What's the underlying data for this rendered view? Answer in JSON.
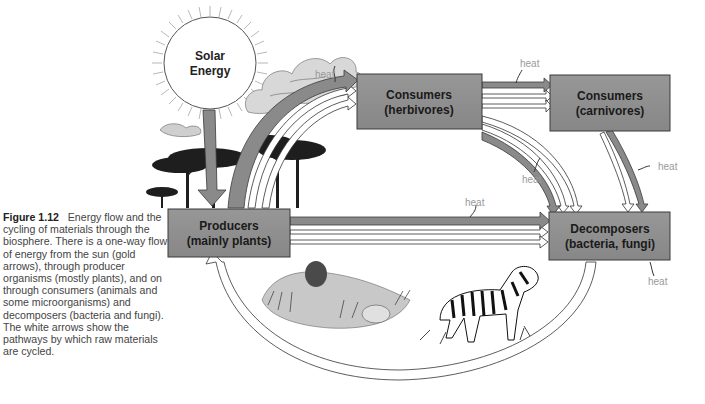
{
  "figure": {
    "number": "Figure 1.12",
    "caption": "Energy flow and the cycling of materials through the biosphere. There is a one-way flow of energy from the sun (gold arrows), through producer organisms (mostly plants), and on through consumers (animals and some microorganisms) and decomposers (bacteria and fungi). The white arrows show the pathways by which raw materials are cycled."
  },
  "sun": {
    "line1": "Solar",
    "line2": "Energy"
  },
  "nodes": {
    "producers": {
      "line1": "Producers",
      "line2": "(mainly plants)"
    },
    "herbivores": {
      "line1": "Consumers",
      "line2": "(herbivores)"
    },
    "carnivores": {
      "line1": "Consumers",
      "line2": "(carnivores)"
    },
    "decomposers": {
      "line1": "Decomposers",
      "line2": "(bacteria, fungi)"
    }
  },
  "heat_labels": {
    "producers_to_herbivores": "heat",
    "herbivores_to_carnivores": "heat",
    "herbivores_to_decomposers": "heat",
    "carnivores_to_decomposers": "heat",
    "producers_to_decomposers": "heat",
    "decomposers_out": "heat"
  },
  "colors": {
    "box_fill": "#8f8f8f",
    "box_stroke": "#3a3a3a",
    "energy_arrow": "#8a8a8a",
    "material_arrow": "#ffffff",
    "heat_text": "#9a9a9a"
  }
}
